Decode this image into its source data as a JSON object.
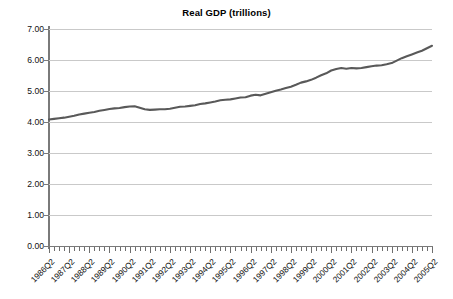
{
  "chart_data": {
    "type": "line",
    "title": "Real GDP (trillions)",
    "xlabel": "",
    "ylabel": "",
    "ylim": [
      0.0,
      7.0
    ],
    "ytick_step": 1.0,
    "ytick_labels": [
      "7.00",
      "6.00",
      "5.00",
      "4.00",
      "3.00",
      "2.00",
      "1.00",
      "0.00"
    ],
    "ytick_values": [
      7.0,
      6.0,
      5.0,
      4.0,
      3.0,
      2.0,
      1.0,
      0.0
    ],
    "grid": true,
    "legend": false,
    "legend_position": "none",
    "line_color": "#595959",
    "grid_color": "#c9c9c9",
    "axis_color": "#7a7a7a",
    "minor_ticks_per_label": 4,
    "categories": [
      "1986Q2",
      "1986Q3",
      "1986Q4",
      "1987Q1",
      "1987Q2",
      "1987Q3",
      "1987Q4",
      "1988Q1",
      "1988Q2",
      "1988Q3",
      "1988Q4",
      "1989Q1",
      "1989Q2",
      "1989Q3",
      "1989Q4",
      "1990Q1",
      "1990Q2",
      "1990Q3",
      "1990Q4",
      "1991Q1",
      "1991Q2",
      "1991Q3",
      "1991Q4",
      "1992Q1",
      "1992Q2",
      "1992Q3",
      "1992Q4",
      "1993Q1",
      "1993Q2",
      "1993Q3",
      "1993Q4",
      "1994Q1",
      "1994Q2",
      "1994Q3",
      "1994Q4",
      "1995Q1",
      "1995Q2",
      "1995Q3",
      "1995Q4",
      "1996Q1",
      "1996Q2",
      "1996Q3",
      "1996Q4",
      "1997Q1",
      "1997Q2",
      "1997Q3",
      "1997Q4",
      "1998Q1",
      "1998Q2",
      "1998Q3",
      "1998Q4",
      "1999Q1",
      "1999Q2",
      "1999Q3",
      "1999Q4",
      "2000Q1",
      "2000Q2",
      "2000Q3",
      "2000Q4",
      "2001Q1",
      "2001Q2",
      "2001Q3",
      "2001Q4",
      "2002Q1",
      "2002Q2",
      "2002Q3",
      "2002Q4",
      "2003Q1",
      "2003Q2",
      "2003Q3",
      "2003Q4",
      "2004Q1",
      "2004Q2",
      "2004Q3",
      "2004Q4",
      "2005Q1",
      "2005Q2"
    ],
    "values": [
      4.08,
      4.1,
      4.12,
      4.14,
      4.17,
      4.2,
      4.24,
      4.27,
      4.3,
      4.32,
      4.36,
      4.39,
      4.42,
      4.44,
      4.45,
      4.48,
      4.5,
      4.51,
      4.46,
      4.41,
      4.39,
      4.4,
      4.41,
      4.41,
      4.43,
      4.46,
      4.49,
      4.5,
      4.52,
      4.54,
      4.58,
      4.6,
      4.63,
      4.66,
      4.7,
      4.72,
      4.73,
      4.76,
      4.79,
      4.8,
      4.85,
      4.88,
      4.86,
      4.91,
      4.96,
      5.01,
      5.05,
      5.1,
      5.14,
      5.2,
      5.27,
      5.31,
      5.36,
      5.43,
      5.51,
      5.57,
      5.66,
      5.71,
      5.74,
      5.72,
      5.74,
      5.73,
      5.74,
      5.77,
      5.8,
      5.82,
      5.83,
      5.86,
      5.9,
      5.98,
      6.06,
      6.12,
      6.18,
      6.24,
      6.3,
      6.38,
      6.46
    ],
    "label_every_n_points": 4,
    "labeled_categories": [
      "1986Q2",
      "1987Q2",
      "1988Q2",
      "1989Q2",
      "1990Q2",
      "1991Q2",
      "1992Q2",
      "1993Q2",
      "1994Q2",
      "1995Q2",
      "1996Q2",
      "1997Q2",
      "1998Q2",
      "1999Q2",
      "2000Q2",
      "2001Q2",
      "2002Q2",
      "2003Q2",
      "2004Q2",
      "2005Q2"
    ]
  }
}
